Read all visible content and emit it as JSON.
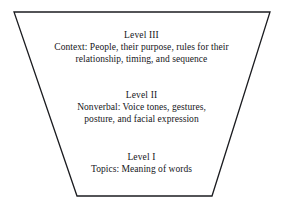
{
  "diagram": {
    "shape": "inverted-trapezoid",
    "outline_color": "#1b1c20",
    "background_color": "#ffffff",
    "vertices": {
      "top_left": [
        14,
        12
      ],
      "top_right": [
        270,
        12
      ],
      "bottom_right": [
        212,
        196
      ],
      "bottom_left": [
        77,
        196
      ]
    },
    "levels": [
      {
        "id": "level-3",
        "heading": "Level III",
        "lines": [
          "Context: People, their purpose, rules for their",
          "relationship, timing, and sequence"
        ]
      },
      {
        "id": "level-2",
        "heading": "Level II",
        "lines": [
          "Nonverbal: Voice tones, gestures,",
          "posture, and facial expression"
        ]
      },
      {
        "id": "level-1",
        "heading": "Level I",
        "lines": [
          "Topics: Meaning of words"
        ]
      }
    ]
  }
}
